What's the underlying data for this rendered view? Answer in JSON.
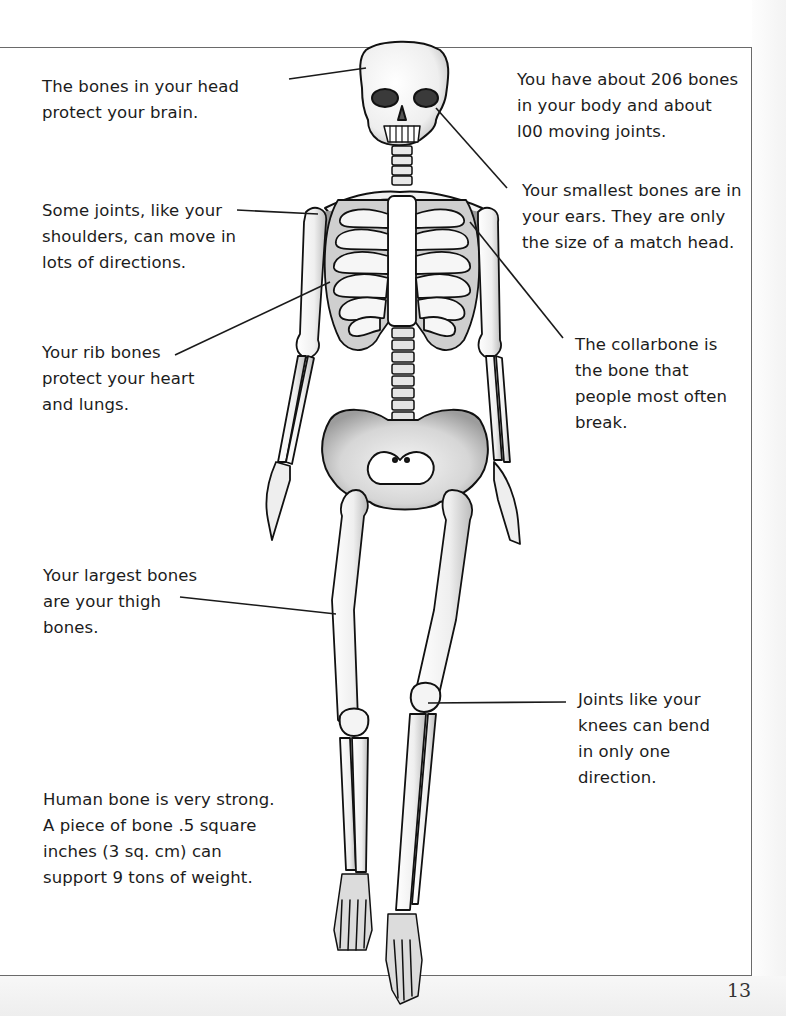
{
  "page": {
    "page_number": "13"
  },
  "illustration": {
    "subject": "human skeleton",
    "icon": "skeleton-illustration"
  },
  "callouts": [
    {
      "id": "head",
      "lines": [
        "The bones in your head",
        "protect your brain."
      ],
      "points_to": "skull"
    },
    {
      "id": "bone-count",
      "lines": [
        "You have about 206 bones",
        "in your body and about",
        "l00 moving joints."
      ],
      "points_to": null
    },
    {
      "id": "smallest-bones",
      "lines": [
        "Your smallest bones are in",
        "your ears. They are only",
        "the size of a match head."
      ],
      "points_to": "ear"
    },
    {
      "id": "shoulders",
      "lines": [
        "Some joints, like your",
        "shoulders, can move in",
        "lots of directions."
      ],
      "points_to": "shoulder"
    },
    {
      "id": "ribs",
      "lines": [
        "Your rib bones",
        "protect your heart",
        "and lungs."
      ],
      "points_to": "rib cage"
    },
    {
      "id": "collarbone",
      "lines": [
        "The collarbone is",
        "the bone that",
        "people most often",
        "break."
      ],
      "points_to": "collarbone"
    },
    {
      "id": "thigh",
      "lines": [
        "Your largest bones",
        "are your thigh",
        "bones."
      ],
      "points_to": "femur"
    },
    {
      "id": "knees",
      "lines": [
        "Joints like your",
        "knees can bend",
        "in only one",
        "direction."
      ],
      "points_to": "knee"
    },
    {
      "id": "strength",
      "lines": [
        "Human bone is very strong.",
        "A piece of bone .5 square",
        "inches (3 sq. cm) can",
        "support 9 tons of weight."
      ],
      "points_to": null
    }
  ],
  "colors": {
    "frame": "#6a6a6a",
    "outline": "#111111",
    "bone_fill": "#f2f2f2",
    "shadow": "#8a8a8a",
    "text": "#1c1c1c"
  }
}
